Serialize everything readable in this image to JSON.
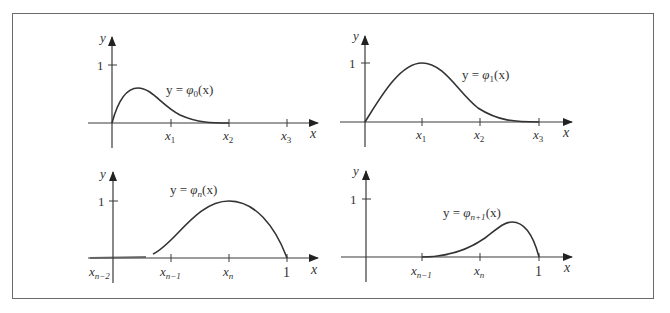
{
  "figure": {
    "panels": [
      {
        "id": "phi0",
        "curve_label": {
          "prefix": "y = ",
          "func": "φ",
          "sub": "0",
          "suffix": "(x)"
        },
        "y_axis_label": "y",
        "x_axis_label": "x",
        "y_tick_label": "1",
        "x_ticks": [
          {
            "base": "x",
            "sub": "1"
          },
          {
            "base": "x",
            "sub": "2"
          },
          {
            "base": "x",
            "sub": "3"
          }
        ]
      },
      {
        "id": "phi1",
        "curve_label": {
          "prefix": "y = ",
          "func": "φ",
          "sub": "1",
          "suffix": "(x)"
        },
        "y_axis_label": "y",
        "x_axis_label": "x",
        "y_tick_label": "1",
        "x_ticks": [
          {
            "base": "x",
            "sub": "1"
          },
          {
            "base": "x",
            "sub": "2"
          },
          {
            "base": "x",
            "sub": "3"
          }
        ]
      },
      {
        "id": "phin",
        "curve_label": {
          "prefix": "y = ",
          "func": "φ",
          "sub": "n",
          "suffix": "(x)"
        },
        "y_axis_label": "y",
        "x_axis_label": "x",
        "y_tick_label": "1",
        "origin_label": {
          "base": "x",
          "sub": "n−2"
        },
        "x_ticks": [
          {
            "base": "x",
            "sub": "n−1"
          },
          {
            "base": "x",
            "sub": "n"
          },
          {
            "base": "1",
            "sub": ""
          }
        ]
      },
      {
        "id": "phin1",
        "curve_label": {
          "prefix": "y = ",
          "func": "φ",
          "sub": "n+1",
          "suffix": "(x)"
        },
        "y_axis_label": "y",
        "x_axis_label": "x",
        "y_tick_label": "1",
        "x_ticks": [
          {
            "base": "x",
            "sub": "n−1"
          },
          {
            "base": "x",
            "sub": "n"
          },
          {
            "base": "1",
            "sub": ""
          }
        ]
      }
    ],
    "colors": {
      "axis": "#3a3a3a",
      "curve": "#333333",
      "frame": "#6a6a6a"
    }
  }
}
